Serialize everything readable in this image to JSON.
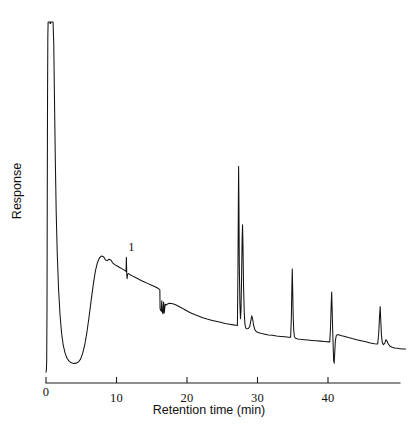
{
  "figure": {
    "background_color": "#ffffff",
    "trace_color": "#141414",
    "axis_color": "#1d1d1d"
  },
  "axes": {
    "x": {
      "label": "Retention time (min)",
      "tick_labels": [
        "0",
        "10",
        "20",
        "30",
        "40"
      ],
      "tick_values": [
        0,
        10,
        20,
        30,
        40
      ],
      "range": [
        0,
        50
      ]
    },
    "y": {
      "label": "Response",
      "tick_labels": [],
      "range": [
        0,
        1
      ]
    }
  },
  "annotations": [
    {
      "text": "1",
      "retention_time": 11.4,
      "name": "peak-label-1"
    }
  ],
  "chart_data": {
    "type": "line",
    "title": "",
    "subtitle": "",
    "xlabel": "Retention time (min)",
    "ylabel": "Response",
    "xlim": [
      0,
      50
    ],
    "ylim": [
      0,
      1
    ],
    "grid": false,
    "legend": null,
    "legend_position": "none",
    "x_unit": "min",
    "series": [
      {
        "name": "chromatogram",
        "color": "#141414",
        "comment": "Detector response versus retention time. y values are normalised 0-1 of the plot box; solvent front is clipped at the top of the frame.",
        "points": [
          [
            0.0,
            0.03
          ],
          [
            0.05,
            0.035
          ],
          [
            0.1,
            0.06
          ],
          [
            0.14,
            0.2
          ],
          [
            0.18,
            0.52
          ],
          [
            0.22,
            0.8
          ],
          [
            0.26,
            0.96
          ],
          [
            0.3,
            1.0
          ],
          [
            0.55,
            1.0
          ],
          [
            0.8,
            1.0
          ],
          [
            1.0,
            1.0
          ],
          [
            1.1,
            0.94
          ],
          [
            1.2,
            0.79
          ],
          [
            1.32,
            0.62
          ],
          [
            1.45,
            0.47
          ],
          [
            1.6,
            0.355
          ],
          [
            1.78,
            0.262
          ],
          [
            1.98,
            0.192
          ],
          [
            2.2,
            0.14
          ],
          [
            2.45,
            0.104
          ],
          [
            2.72,
            0.082
          ],
          [
            3.0,
            0.068
          ],
          [
            3.3,
            0.06
          ],
          [
            3.6,
            0.056
          ],
          [
            3.95,
            0.054
          ],
          [
            4.3,
            0.055
          ],
          [
            4.6,
            0.058
          ],
          [
            4.9,
            0.066
          ],
          [
            5.2,
            0.082
          ],
          [
            5.5,
            0.106
          ],
          [
            5.8,
            0.14
          ],
          [
            6.1,
            0.182
          ],
          [
            6.4,
            0.228
          ],
          [
            6.7,
            0.272
          ],
          [
            7.0,
            0.31
          ],
          [
            7.3,
            0.334
          ],
          [
            7.6,
            0.347
          ],
          [
            7.9,
            0.352
          ],
          [
            8.2,
            0.349
          ],
          [
            8.45,
            0.341
          ],
          [
            8.7,
            0.339
          ],
          [
            8.95,
            0.343
          ],
          [
            9.2,
            0.341
          ],
          [
            9.45,
            0.333
          ],
          [
            9.75,
            0.328
          ],
          [
            10.1,
            0.324
          ],
          [
            10.45,
            0.32
          ],
          [
            10.8,
            0.316
          ],
          [
            11.15,
            0.312
          ],
          [
            11.35,
            0.309
          ],
          [
            11.4,
            0.348
          ],
          [
            11.45,
            0.306
          ],
          [
            11.5,
            0.289
          ],
          [
            11.58,
            0.301
          ],
          [
            11.7,
            0.303
          ],
          [
            11.95,
            0.3
          ],
          [
            12.3,
            0.296
          ],
          [
            12.7,
            0.292
          ],
          [
            13.1,
            0.288
          ],
          [
            13.5,
            0.284
          ],
          [
            13.95,
            0.28
          ],
          [
            14.4,
            0.276
          ],
          [
            14.85,
            0.272
          ],
          [
            15.3,
            0.268
          ],
          [
            15.75,
            0.264
          ],
          [
            16.05,
            0.26
          ],
          [
            16.15,
            0.258
          ],
          [
            16.18,
            0.206
          ],
          [
            16.25,
            0.202
          ],
          [
            16.35,
            0.199
          ],
          [
            16.42,
            0.228
          ],
          [
            16.5,
            0.196
          ],
          [
            16.6,
            0.192
          ],
          [
            16.68,
            0.224
          ],
          [
            16.78,
            0.194
          ],
          [
            16.9,
            0.218
          ],
          [
            17.05,
            0.216
          ],
          [
            17.25,
            0.219
          ],
          [
            17.5,
            0.221
          ],
          [
            17.8,
            0.22
          ],
          [
            18.1,
            0.219
          ],
          [
            18.45,
            0.216
          ],
          [
            18.85,
            0.212
          ],
          [
            19.25,
            0.208
          ],
          [
            19.7,
            0.203
          ],
          [
            20.15,
            0.198
          ],
          [
            20.65,
            0.193
          ],
          [
            21.15,
            0.189
          ],
          [
            21.7,
            0.185
          ],
          [
            22.25,
            0.181
          ],
          [
            22.85,
            0.177
          ],
          [
            23.45,
            0.174
          ],
          [
            24.1,
            0.171
          ],
          [
            24.75,
            0.168
          ],
          [
            25.4,
            0.165
          ],
          [
            26.05,
            0.163
          ],
          [
            26.6,
            0.161
          ],
          [
            26.95,
            0.16
          ],
          [
            27.15,
            0.159
          ],
          [
            27.22,
            0.3
          ],
          [
            27.28,
            0.48
          ],
          [
            27.32,
            0.6
          ],
          [
            27.36,
            0.51
          ],
          [
            27.42,
            0.33
          ],
          [
            27.5,
            0.22
          ],
          [
            27.58,
            0.178
          ],
          [
            27.66,
            0.2
          ],
          [
            27.74,
            0.29
          ],
          [
            27.82,
            0.4
          ],
          [
            27.88,
            0.438
          ],
          [
            27.94,
            0.38
          ],
          [
            28.02,
            0.27
          ],
          [
            28.12,
            0.195
          ],
          [
            28.22,
            0.162
          ],
          [
            28.35,
            0.152
          ],
          [
            28.5,
            0.15
          ],
          [
            28.7,
            0.151
          ],
          [
            28.9,
            0.156
          ],
          [
            29.05,
            0.172
          ],
          [
            29.18,
            0.186
          ],
          [
            29.3,
            0.178
          ],
          [
            29.45,
            0.16
          ],
          [
            29.62,
            0.148
          ],
          [
            29.85,
            0.142
          ],
          [
            30.2,
            0.139
          ],
          [
            30.6,
            0.137
          ],
          [
            31.05,
            0.135
          ],
          [
            31.55,
            0.133
          ],
          [
            32.1,
            0.132
          ],
          [
            32.7,
            0.13
          ],
          [
            33.3,
            0.129
          ],
          [
            33.9,
            0.128
          ],
          [
            34.4,
            0.127
          ],
          [
            34.7,
            0.127
          ],
          [
            34.8,
            0.18
          ],
          [
            34.88,
            0.27
          ],
          [
            34.93,
            0.316
          ],
          [
            34.99,
            0.262
          ],
          [
            35.06,
            0.186
          ],
          [
            35.14,
            0.145
          ],
          [
            35.24,
            0.128
          ],
          [
            35.4,
            0.124
          ],
          [
            35.7,
            0.122
          ],
          [
            36.1,
            0.121
          ],
          [
            36.6,
            0.12
          ],
          [
            37.15,
            0.119
          ],
          [
            37.7,
            0.118
          ],
          [
            38.3,
            0.117
          ],
          [
            38.9,
            0.116
          ],
          [
            39.45,
            0.115
          ],
          [
            39.9,
            0.114
          ],
          [
            40.25,
            0.114
          ],
          [
            40.35,
            0.15
          ],
          [
            40.45,
            0.215
          ],
          [
            40.52,
            0.252
          ],
          [
            40.58,
            0.21
          ],
          [
            40.66,
            0.15
          ],
          [
            40.74,
            0.098
          ],
          [
            40.8,
            0.062
          ],
          [
            40.88,
            0.055
          ],
          [
            40.96,
            0.086
          ],
          [
            41.05,
            0.118
          ],
          [
            41.18,
            0.132
          ],
          [
            41.35,
            0.134
          ],
          [
            41.6,
            0.133
          ],
          [
            41.95,
            0.131
          ],
          [
            42.4,
            0.129
          ],
          [
            42.9,
            0.126
          ],
          [
            43.45,
            0.123
          ],
          [
            44.05,
            0.12
          ],
          [
            44.7,
            0.117
          ],
          [
            45.35,
            0.114
          ],
          [
            46.0,
            0.111
          ],
          [
            46.6,
            0.109
          ],
          [
            47.05,
            0.108
          ],
          [
            47.2,
            0.14
          ],
          [
            47.32,
            0.188
          ],
          [
            47.4,
            0.212
          ],
          [
            47.48,
            0.176
          ],
          [
            47.58,
            0.132
          ],
          [
            47.7,
            0.112
          ],
          [
            47.85,
            0.106
          ],
          [
            48.05,
            0.11
          ],
          [
            48.2,
            0.12
          ],
          [
            48.35,
            0.117
          ],
          [
            48.55,
            0.108
          ],
          [
            48.8,
            0.102
          ],
          [
            49.1,
            0.099
          ],
          [
            49.45,
            0.097
          ],
          [
            49.8,
            0.096
          ],
          [
            50.2,
            0.095
          ],
          [
            50.6,
            0.094
          ],
          [
            51.0,
            0.094
          ]
        ]
      }
    ],
    "peaks": [
      {
        "label": "1",
        "retention_time": 11.4
      },
      {
        "label": "",
        "retention_time": 27.3
      },
      {
        "label": "",
        "retention_time": 27.9
      },
      {
        "label": "",
        "retention_time": 29.2
      },
      {
        "label": "",
        "retention_time": 34.9
      },
      {
        "label": "",
        "retention_time": 40.5
      },
      {
        "label": "",
        "retention_time": 47.4
      }
    ]
  }
}
